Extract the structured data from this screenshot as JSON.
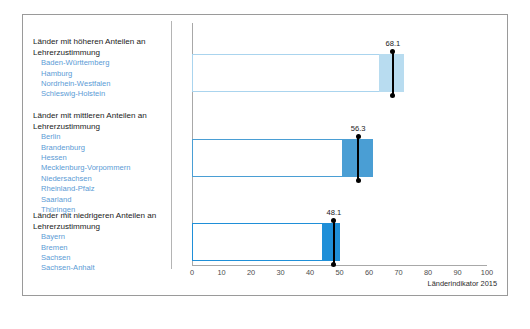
{
  "footnote": "Länderindikator 2015",
  "groups": [
    {
      "title_line1": "Länder mit höheren Anteilen an",
      "title_line2": "Lehrerzustimmung",
      "states": [
        "Baden-Württemberg",
        "Hamburg",
        "Nordrhein-Westfalen",
        "Schleswig-Holstein"
      ]
    },
    {
      "title_line1": "Länder mit mittleren Anteilen an",
      "title_line2": "Lehrerzustimmung",
      "states": [
        "Berlin",
        "Brandenburg",
        "Hessen",
        "Mecklenburg-Vorpommern",
        "Niedersachsen",
        "Rheinland-Pfalz",
        "Saarland",
        "Thüringen"
      ]
    },
    {
      "title_line1": "Länder mit niedrigeren Anteilen an",
      "title_line2": "Lehrerzustimmung",
      "states": [
        "Bayern",
        "Bremen",
        "Sachsen",
        "Sachsen-Anhalt"
      ]
    }
  ],
  "chart_data": {
    "type": "bar",
    "orientation": "horizontal",
    "title": "",
    "xlabel": "",
    "ylabel": "",
    "xlim": [
      0,
      100
    ],
    "xticks": [
      0,
      10,
      20,
      30,
      40,
      50,
      60,
      70,
      80,
      90,
      100
    ],
    "grid": false,
    "legend": "none",
    "categories": [
      "Länder mit höheren Anteilen an Lehrerzustimmung",
      "Länder mit mittleren Anteilen an Lehrerzustimmung",
      "Länder mit niedrigeren Anteilen an Lehrerzustimmung"
    ],
    "values": [
      68.1,
      56.3,
      48.1
    ],
    "value_labels": [
      "68.1",
      "56.3",
      "48.1"
    ],
    "bars": [
      {
        "category": "Länder mit höheren Anteilen an Lehrerzustimmung",
        "value": 68.1,
        "value_label": "68.1",
        "bar_start": 0,
        "bar_end": 72.0,
        "fill_start": 63.5,
        "fill_color": "#b8dcf0",
        "outline_color": "#aad4ee",
        "marker_color": "#000000"
      },
      {
        "category": "Länder mit mittleren Anteilen an Lehrerzustimmung",
        "value": 56.3,
        "value_label": "56.3",
        "bar_start": 0,
        "bar_end": 61.3,
        "fill_start": 51.0,
        "fill_color": "#4a9ed4",
        "outline_color": "#4a9ed4",
        "marker_color": "#000000"
      },
      {
        "category": "Länder mit niedrigeren Anteilen an Lehrerzustimmung",
        "value": 48.1,
        "value_label": "48.1",
        "bar_start": 0,
        "bar_end": 50.2,
        "fill_start": 44.0,
        "fill_color": "#1f8fd8",
        "outline_color": "#1f8fd8",
        "marker_color": "#000000"
      }
    ]
  }
}
